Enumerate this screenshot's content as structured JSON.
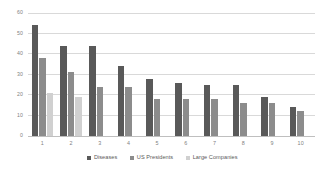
{
  "chart_data": {
    "type": "bar",
    "title": "",
    "subtitle": "",
    "xlabel": "",
    "ylabel": "",
    "categories": [
      "1",
      "2",
      "3",
      "4",
      "5",
      "6",
      "7",
      "8",
      "9",
      "10"
    ],
    "series": [
      {
        "name": "Diseases",
        "color": "#595959",
        "values": [
          54,
          44,
          44,
          34,
          28,
          26,
          25,
          25,
          19,
          14
        ]
      },
      {
        "name": "US Presidents",
        "color": "#8c8c8c",
        "values": [
          38,
          31,
          24,
          24,
          18,
          18,
          18,
          16,
          16,
          12
        ]
      },
      {
        "name": "Large Companies",
        "color": "#d0d0d0",
        "values": [
          21,
          19,
          null,
          null,
          null,
          null,
          null,
          null,
          null,
          null
        ]
      }
    ],
    "ylim": [
      0,
      60
    ],
    "yticks": [
      0,
      10,
      20,
      30,
      40,
      50,
      60
    ],
    "ytick_labels": [
      "0",
      "10",
      "20",
      "30",
      "40",
      "50",
      "60"
    ],
    "grid": "horizontal",
    "legend_position": "bottom",
    "background_color": "#ffffff",
    "gridline_color": "#d9d9d9"
  }
}
